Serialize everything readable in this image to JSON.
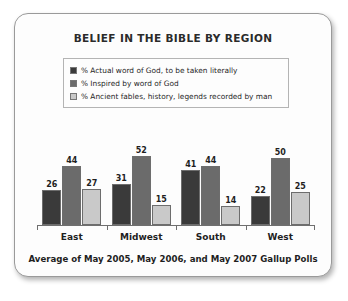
{
  "chart_data": {
    "type": "bar",
    "title": "BELIEF IN THE BIBLE BY REGION",
    "footnote": "Average of May 2005, May 2006, and May 2007 Gallup Polls",
    "categories": [
      "East",
      "Midwest",
      "South",
      "West"
    ],
    "series": [
      {
        "name": "% Actual word of God, to be taken literally",
        "color": "#3a3a3a",
        "values": [
          26,
          31,
          41,
          22
        ]
      },
      {
        "name": "% Inspired by word of God",
        "color": "#6b6b6b",
        "values": [
          44,
          52,
          44,
          50
        ]
      },
      {
        "name": "% Ancient fables, history, legends recorded by man",
        "color": "#c9c9c9",
        "values": [
          27,
          15,
          14,
          25
        ]
      }
    ],
    "xlabel": "",
    "ylabel": "",
    "ylim": [
      0,
      60
    ],
    "grid": false,
    "legend_position": "top"
  }
}
